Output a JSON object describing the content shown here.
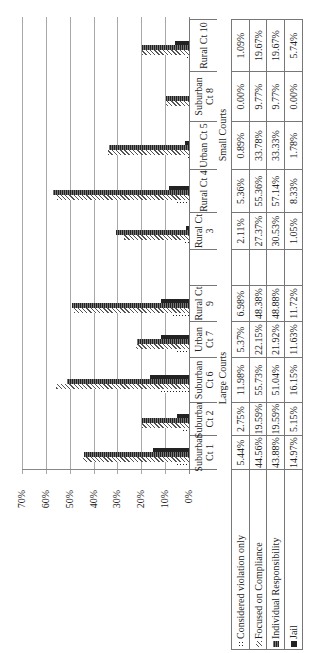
{
  "chart_data": {
    "type": "bar",
    "orientation": "rotated-90-ccw clustered column chart with data table",
    "title": "",
    "xlabel": "",
    "ylabel": "",
    "ylim": [
      0,
      70
    ],
    "yticks": [
      "0%",
      "10%",
      "20%",
      "30%",
      "40%",
      "50%",
      "60%",
      "70%"
    ],
    "grid": true,
    "legend_position": "in data table (left column)",
    "groups": [
      {
        "name": "Large Courts",
        "categories": [
          "Suburban Ct 1",
          "Suburban Ct 2",
          "Suburban Ct 6",
          "Urban Ct 7",
          "Rural Ct 9"
        ]
      },
      {
        "name": "Small Courts",
        "categories": [
          "Rural Ct 3",
          "Rural Ct 4",
          "Urban Ct 5",
          "Suburban Ct 8",
          "Rural Ct 10"
        ]
      }
    ],
    "categories": [
      "Suburban Ct 1",
      "Suburban Ct 2",
      "Suburban Ct 6",
      "Urban Ct 7",
      "Rural Ct 9",
      "",
      "Rural Ct 3",
      "Rural Ct 4",
      "Urban Ct 5",
      "Suburban Ct 8",
      "Rural Ct 10"
    ],
    "series": [
      {
        "name": "Considered violation only",
        "pattern": "dots",
        "values": [
          5.44,
          2.75,
          11.98,
          5.37,
          6.98,
          null,
          2.11,
          5.36,
          0.89,
          0.0,
          1.09
        ]
      },
      {
        "name": "Focused on Compliance",
        "pattern": "diagonal",
        "values": [
          44.56,
          19.59,
          55.73,
          22.15,
          48.38,
          null,
          27.37,
          55.36,
          33.78,
          9.77,
          19.67
        ]
      },
      {
        "name": "Individual Responsibility",
        "pattern": "dense",
        "values": [
          43.88,
          19.59,
          51.04,
          21.92,
          48.88,
          null,
          30.53,
          57.14,
          33.33,
          9.77,
          19.67
        ]
      },
      {
        "name": "Jail",
        "pattern": "solid",
        "values": [
          14.97,
          5.15,
          16.15,
          11.63,
          11.72,
          null,
          1.05,
          8.33,
          1.78,
          0.0,
          5.74
        ]
      }
    ]
  },
  "table": {
    "headers": [
      "Suburban Ct 1",
      "Suburban Ct 2",
      "Suburban Ct 6",
      "Urban Ct 7",
      "Rural Ct 9",
      "",
      "Rural Ct 3",
      "Rural Ct 4",
      "Urban Ct 5",
      "Suburban Ct 8",
      "Rural Ct 10"
    ],
    "group_labels": {
      "large": "Large Courts",
      "small": "Small Courts"
    },
    "rows": [
      {
        "label": "Considered violation only",
        "values": [
          "5.44%",
          "2.75%",
          "11.98%",
          "5.37%",
          "6.98%",
          "",
          "2.11%",
          "5.36%",
          "0.89%",
          "0.00%",
          "1.09%"
        ]
      },
      {
        "label": "Focused on Compliance",
        "values": [
          "44.56%",
          "19.59%",
          "55.73%",
          "22.15%",
          "48.38%",
          "",
          "27.37%",
          "55.36%",
          "33.78%",
          "9.77%",
          "19.67%"
        ]
      },
      {
        "label": "Individual Responsibility",
        "values": [
          "43.88%",
          "19.59%",
          "51.04%",
          "21.92%",
          "48.88%",
          "",
          "30.53%",
          "57.14%",
          "33.33%",
          "9.77%",
          "19.67%"
        ]
      },
      {
        "label": "Jail",
        "values": [
          "14.97%",
          "5.15%",
          "16.15%",
          "11.63%",
          "11.72%",
          "",
          "1.05%",
          "8.33%",
          "1.78%",
          "0.00%",
          "5.74%"
        ]
      }
    ]
  }
}
